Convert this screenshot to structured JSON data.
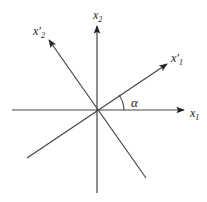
{
  "diagram": {
    "type": "coordinate-rotation",
    "axes": [
      {
        "id": "x1",
        "label": "x",
        "subscript": "1",
        "prime": false
      },
      {
        "id": "x2",
        "label": "x",
        "subscript": "2",
        "prime": false
      },
      {
        "id": "x1p",
        "label": "x",
        "subscript": "1",
        "prime": true
      },
      {
        "id": "x2p",
        "label": "x",
        "subscript": "2",
        "prime": true
      }
    ],
    "angle_label": "α",
    "line_color": "#333333"
  }
}
